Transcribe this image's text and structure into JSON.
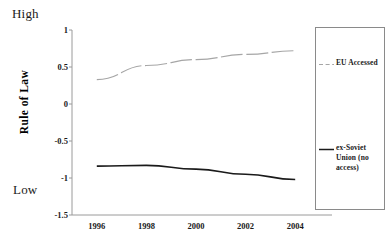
{
  "annotations": {
    "high": "High",
    "low": "Low"
  },
  "legend": {
    "eu": {
      "label": "EU Accessed",
      "color": "#a6a6a6",
      "style": "dashed",
      "swatch_name": "legend-swatch-dashed-gray"
    },
    "soviet": {
      "label": "ex-Soviet Union (no access)",
      "color": "#1a1a1a",
      "style": "solid",
      "swatch_name": "legend-swatch-solid-black"
    }
  },
  "chart_data": {
    "type": "line",
    "title": "",
    "xlabel": "",
    "ylabel": "Rule of Law",
    "xlim": [
      1995,
      2005
    ],
    "ylim": [
      -1.5,
      1
    ],
    "yticks": [
      1,
      0.5,
      0,
      -0.5,
      -1,
      -1.5
    ],
    "ytick_labels": [
      "1",
      "0.5",
      "0",
      "-0.5",
      "-1",
      "-1.5"
    ],
    "xticks": [
      1996,
      1998,
      2000,
      2002,
      2004
    ],
    "xtick_labels": [
      "1996",
      "1998",
      "2000",
      "2002",
      "2004"
    ],
    "x": [
      1996,
      1998,
      2000,
      2002,
      2004
    ],
    "grid": false,
    "legend_position": "right",
    "series": [
      {
        "name": "EU Accessed",
        "color": "#a6a6a6",
        "style": "dashed",
        "values": [
          0.33,
          0.52,
          0.6,
          0.67,
          0.72
        ]
      },
      {
        "name": "ex-Soviet Union (no access)",
        "color": "#1a1a1a",
        "style": "solid",
        "values": [
          -0.84,
          -0.83,
          -0.88,
          -0.95,
          -1.02
        ]
      }
    ]
  }
}
